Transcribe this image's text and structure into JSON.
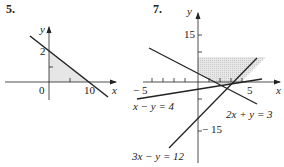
{
  "problems": [
    {
      "number": "5.",
      "axes": {
        "x": "x",
        "y": "y"
      },
      "ticks": {
        "y": "2",
        "x": "10",
        "origin": "0"
      }
    },
    {
      "number": "7.",
      "axes": {
        "x": "x",
        "y": "y"
      },
      "ticks": {
        "y_top": "15",
        "y_bottom": "− 15",
        "x_left": "− 5",
        "x_right": "5"
      },
      "equations": [
        "x − y = 4",
        "2x + y = 3",
        "3x − y = 12"
      ]
    }
  ],
  "colors": {
    "line": "#222222",
    "shade": "#e4e4e4"
  }
}
